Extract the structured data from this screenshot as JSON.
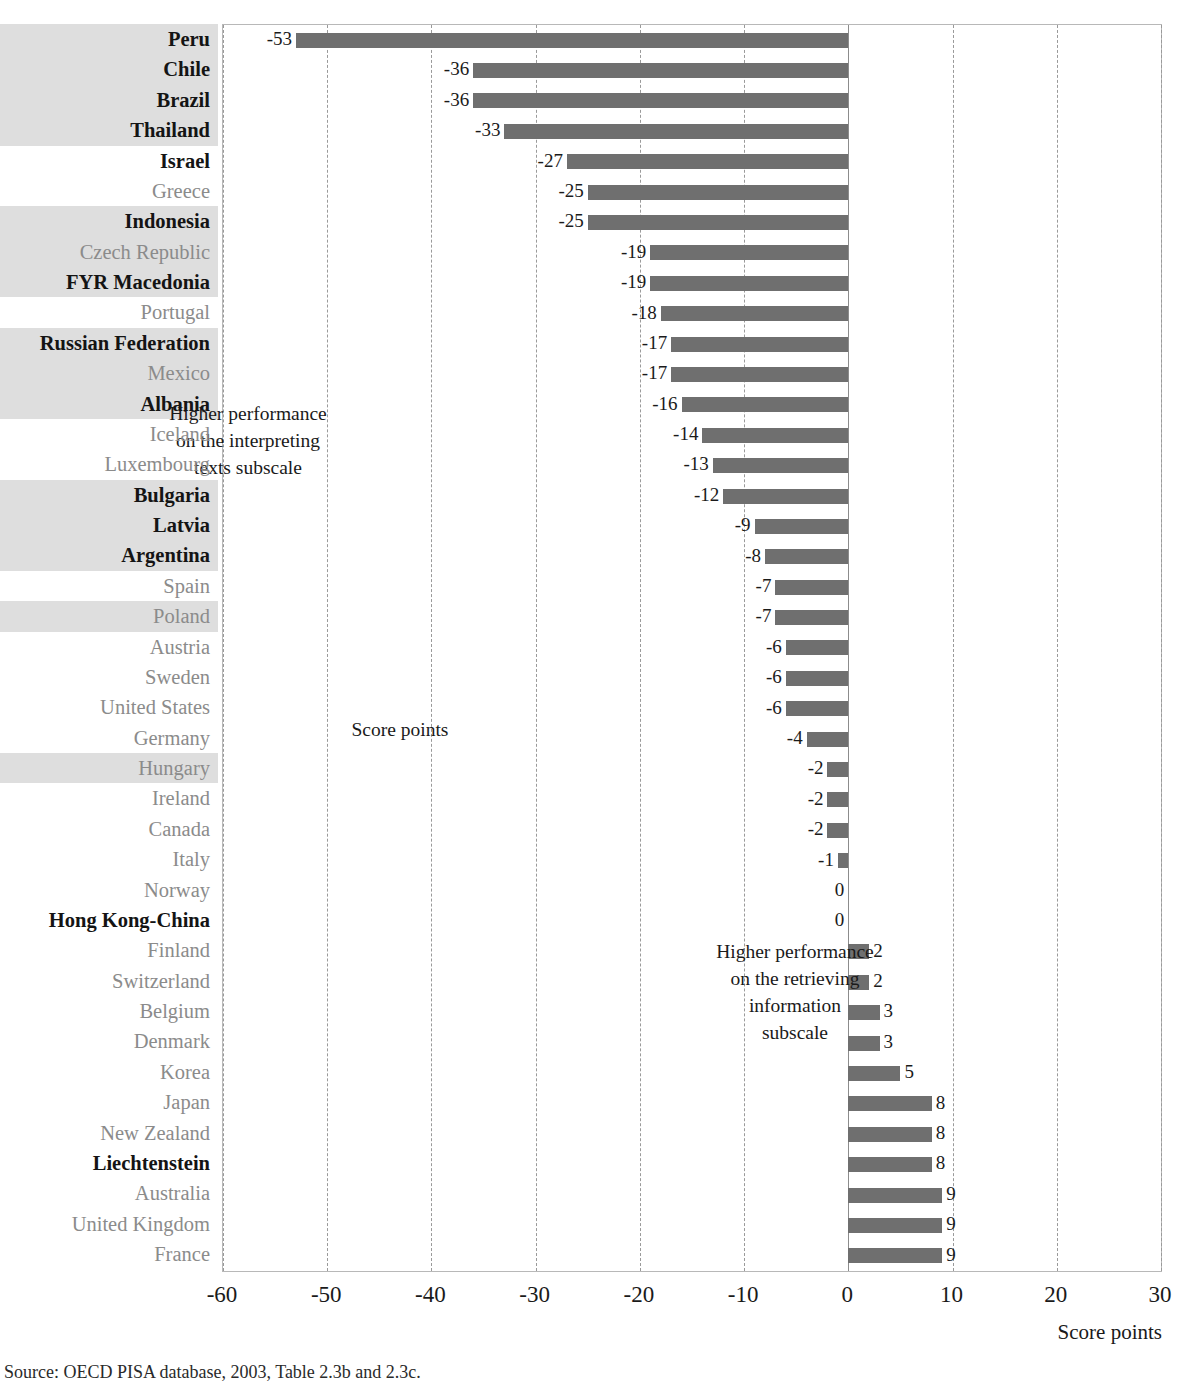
{
  "chart_data": {
    "type": "bar",
    "orientation": "horizontal",
    "title": "",
    "xlabel": "Score points",
    "ylabel": "",
    "xlim": [
      -60,
      30
    ],
    "xticks": [
      -60,
      -50,
      -40,
      -30,
      -20,
      -10,
      0,
      10,
      20,
      30
    ],
    "xtick_labels": [
      "-60",
      "-50",
      "-40",
      "-30",
      "-20",
      "-10",
      "0",
      "10",
      "20",
      "30"
    ],
    "grid": true,
    "grid_style": "dashed vertical",
    "legend": "none",
    "bar_color": "#6f6f6f",
    "categories": [
      "Peru",
      "Chile",
      "Brazil",
      "Thailand",
      "Israel",
      "Greece",
      "Indonesia",
      "Czech Republic",
      "FYR Macedonia",
      "Portugal",
      "Russian Federation",
      "Mexico",
      "Albania",
      "Iceland",
      "Luxembourg",
      "Bulgaria",
      "Latvia",
      "Argentina",
      "Spain",
      "Poland",
      "Austria",
      "Sweden",
      "United States",
      "Germany",
      "Hungary",
      "Ireland",
      "Canada",
      "Italy",
      "Norway",
      "Hong Kong-China",
      "Finland",
      "Switzerland",
      "Belgium",
      "Denmark",
      "Korea",
      "Japan",
      "New Zealand",
      "Liechtenstein",
      "Australia",
      "United Kingdom",
      "France"
    ],
    "values": [
      -53,
      -36,
      -36,
      -33,
      -27,
      -25,
      -25,
      -19,
      -19,
      -18,
      -17,
      -17,
      -16,
      -14,
      -13,
      -12,
      -9,
      -8,
      -7,
      -7,
      -6,
      -6,
      -6,
      -4,
      -2,
      -2,
      -2,
      -1,
      0,
      0,
      2,
      2,
      3,
      3,
      5,
      8,
      8,
      8,
      9,
      9,
      9
    ],
    "value_labels": [
      "-53",
      "-36",
      "-36",
      "-33",
      "-27",
      "-25",
      "-25",
      "-19",
      "-19",
      "-18",
      "-17",
      "-17",
      "-16",
      "-14",
      "-13",
      "-12",
      "-9",
      "-8",
      "-7",
      "-7",
      "-6",
      "-6",
      "-6",
      "-4",
      "-2",
      "-2",
      "-2",
      "-1",
      "0",
      "0",
      "2",
      "2",
      "3",
      "3",
      "5",
      "8",
      "8",
      "8",
      "9",
      "9",
      "9"
    ],
    "partner_countries": [
      "Peru",
      "Chile",
      "Brazil",
      "Thailand",
      "Israel",
      "Indonesia",
      "FYR Macedonia",
      "Russian Federation",
      "Albania",
      "Bulgaria",
      "Latvia",
      "Argentina",
      "Hong Kong-China",
      "Liechtenstein"
    ],
    "highlight_banded": [
      "Peru",
      "Chile",
      "Brazil",
      "Thailand",
      "Indonesia",
      "Czech Republic",
      "FYR Macedonia",
      "Russian Federation",
      "Mexico",
      "Albania",
      "Bulgaria",
      "Latvia",
      "Argentina",
      "Poland",
      "Hungary"
    ],
    "annotations": [
      {
        "id": "left",
        "text": "Higher performance\non the interpreting\ntexts subscale"
      },
      {
        "id": "right",
        "text": "Higher performance\non the retrieving\ninformation\nsubscale"
      },
      {
        "id": "center",
        "text": "Score points"
      }
    ]
  },
  "annotations": {
    "left": [
      "Higher performance",
      "on the interpreting",
      "texts subscale"
    ],
    "right": [
      "Higher performance",
      "on the retrieving",
      "information",
      "subscale"
    ],
    "score_points": "Score points"
  },
  "axis": {
    "title": "Score points"
  },
  "source": {
    "text": "Source: OECD PISA database, 2003, Table 2.3b and 2.3c."
  }
}
